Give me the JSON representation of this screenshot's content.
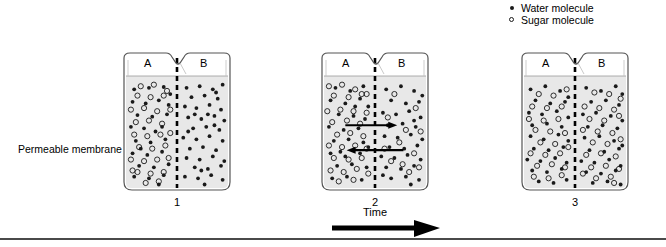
{
  "legend": {
    "items": [
      {
        "marker": "filled-dot",
        "label": "Water molecule"
      },
      {
        "marker": "open-circle",
        "label": "Sugar molecule"
      }
    ]
  },
  "annotations": {
    "membrane_label": "Permeable membrane",
    "time_label": "Time"
  },
  "beakers": [
    {
      "number": "1",
      "left_label": "A",
      "right_label": "B",
      "state": "initial",
      "x": 122,
      "sideA": {
        "water": [
          [
            10,
            12
          ],
          [
            28,
            10
          ],
          [
            46,
            9
          ],
          [
            8,
            28
          ],
          [
            24,
            30
          ],
          [
            40,
            26
          ],
          [
            52,
            32
          ],
          [
            14,
            45
          ],
          [
            32,
            47
          ],
          [
            50,
            44
          ],
          [
            6,
            60
          ],
          [
            22,
            62
          ],
          [
            44,
            60
          ],
          [
            12,
            78
          ],
          [
            30,
            80
          ],
          [
            48,
            76
          ],
          [
            8,
            94
          ],
          [
            26,
            96
          ],
          [
            44,
            92
          ],
          [
            16,
            110
          ],
          [
            34,
            112
          ],
          [
            52,
            108
          ],
          [
            10,
            124
          ],
          [
            28,
            126
          ],
          [
            46,
            122
          ],
          [
            20,
            136
          ],
          [
            40,
            134
          ],
          [
            54,
            18
          ],
          [
            36,
            66
          ],
          [
            18,
            88
          ]
        ],
        "sugar": [
          [
            18,
            8
          ],
          [
            34,
            6
          ],
          [
            50,
            14
          ],
          [
            14,
            20
          ],
          [
            30,
            22
          ],
          [
            46,
            20
          ],
          [
            6,
            38
          ],
          [
            22,
            36
          ],
          [
            38,
            40
          ],
          [
            54,
            38
          ],
          [
            12,
            54
          ],
          [
            28,
            52
          ],
          [
            44,
            56
          ],
          [
            10,
            70
          ],
          [
            26,
            72
          ],
          [
            42,
            70
          ],
          [
            54,
            68
          ],
          [
            16,
            86
          ],
          [
            32,
            88
          ],
          [
            48,
            84
          ],
          [
            6,
            102
          ],
          [
            22,
            104
          ],
          [
            38,
            102
          ],
          [
            52,
            100
          ],
          [
            14,
            118
          ],
          [
            30,
            120
          ],
          [
            46,
            118
          ],
          [
            24,
            132
          ],
          [
            40,
            130
          ],
          [
            8,
            116
          ]
        ]
      },
      "sideB": {
        "water": [
          [
            8,
            10
          ],
          [
            24,
            8
          ],
          [
            40,
            12
          ],
          [
            52,
            6
          ],
          [
            14,
            22
          ],
          [
            30,
            20
          ],
          [
            46,
            24
          ],
          [
            6,
            34
          ],
          [
            20,
            36
          ],
          [
            36,
            32
          ],
          [
            50,
            38
          ],
          [
            10,
            48
          ],
          [
            26,
            50
          ],
          [
            42,
            46
          ],
          [
            54,
            52
          ],
          [
            16,
            62
          ],
          [
            32,
            60
          ],
          [
            48,
            64
          ],
          [
            4,
            74
          ],
          [
            20,
            76
          ],
          [
            36,
            72
          ],
          [
            52,
            78
          ],
          [
            12,
            88
          ],
          [
            28,
            86
          ],
          [
            44,
            90
          ],
          [
            8,
            100
          ],
          [
            24,
            102
          ],
          [
            40,
            98
          ],
          [
            54,
            104
          ],
          [
            18,
            112
          ],
          [
            34,
            114
          ],
          [
            50,
            110
          ],
          [
            6,
            124
          ],
          [
            22,
            126
          ],
          [
            38,
            122
          ],
          [
            52,
            128
          ],
          [
            14,
            136
          ],
          [
            30,
            134
          ],
          [
            46,
            138
          ],
          [
            44,
            16
          ],
          [
            18,
            44
          ],
          [
            10,
            66
          ],
          [
            34,
            44
          ],
          [
            26,
            116
          ],
          [
            42,
            58
          ]
        ]
      }
    },
    {
      "number": "2",
      "left_label": "A",
      "right_label": "B",
      "state": "diffusing",
      "x": 320,
      "arrows": [
        {
          "direction": "right",
          "y": 58,
          "x_start": 26,
          "x_end": 76,
          "meaning": "sugar-moves-A-to-B"
        },
        {
          "direction": "left",
          "y": 90,
          "x_start": 30,
          "x_end": 86,
          "meaning": "water-moves-B-to-A"
        }
      ],
      "sideA": {
        "water": [
          [
            14,
            10
          ],
          [
            32,
            14
          ],
          [
            48,
            8
          ],
          [
            8,
            26
          ],
          [
            26,
            30
          ],
          [
            44,
            24
          ],
          [
            54,
            34
          ],
          [
            18,
            44
          ],
          [
            36,
            46
          ],
          [
            50,
            50
          ],
          [
            6,
            60
          ],
          [
            24,
            64
          ],
          [
            42,
            62
          ],
          [
            12,
            78
          ],
          [
            30,
            76
          ],
          [
            48,
            80
          ],
          [
            8,
            94
          ],
          [
            26,
            98
          ],
          [
            44,
            94
          ],
          [
            16,
            110
          ],
          [
            34,
            108
          ],
          [
            52,
            112
          ],
          [
            10,
            126
          ],
          [
            28,
            124
          ],
          [
            46,
            128
          ],
          [
            22,
            136
          ],
          [
            40,
            138
          ],
          [
            54,
            86
          ],
          [
            38,
            34
          ],
          [
            20,
            92
          ]
        ],
        "sugar": [
          [
            6,
            8
          ],
          [
            22,
            6
          ],
          [
            38,
            12
          ],
          [
            52,
            18
          ],
          [
            12,
            20
          ],
          [
            30,
            22
          ],
          [
            46,
            18
          ],
          [
            4,
            40
          ],
          [
            20,
            38
          ],
          [
            36,
            40
          ],
          [
            52,
            42
          ],
          [
            10,
            54
          ],
          [
            28,
            52
          ],
          [
            44,
            56
          ],
          [
            16,
            70
          ],
          [
            32,
            68
          ],
          [
            48,
            72
          ],
          [
            6,
            84
          ],
          [
            22,
            86
          ],
          [
            38,
            84
          ],
          [
            52,
            88
          ],
          [
            12,
            100
          ],
          [
            30,
            102
          ],
          [
            46,
            100
          ],
          [
            8,
            116
          ],
          [
            24,
            118
          ],
          [
            40,
            114
          ],
          [
            54,
            120
          ],
          [
            18,
            130
          ],
          [
            36,
            128
          ]
        ]
      },
      "sideB": {
        "water": [
          [
            10,
            12
          ],
          [
            28,
            8
          ],
          [
            44,
            14
          ],
          [
            54,
            20
          ],
          [
            16,
            26
          ],
          [
            34,
            30
          ],
          [
            50,
            28
          ],
          [
            6,
            42
          ],
          [
            22,
            44
          ],
          [
            38,
            40
          ],
          [
            52,
            48
          ],
          [
            12,
            58
          ],
          [
            30,
            56
          ],
          [
            46,
            60
          ],
          [
            8,
            72
          ],
          [
            24,
            74
          ],
          [
            40,
            70
          ],
          [
            54,
            76
          ],
          [
            14,
            86
          ],
          [
            32,
            88
          ],
          [
            48,
            84
          ],
          [
            4,
            98
          ],
          [
            20,
            100
          ],
          [
            36,
            96
          ],
          [
            52,
            102
          ],
          [
            10,
            112
          ],
          [
            28,
            114
          ],
          [
            44,
            110
          ],
          [
            16,
            126
          ],
          [
            34,
            124
          ],
          [
            50,
            128
          ],
          [
            22,
            136
          ],
          [
            40,
            134
          ],
          [
            6,
            122
          ],
          [
            44,
            52
          ]
        ],
        "sugar": [
          [
            20,
            18
          ],
          [
            46,
            36
          ],
          [
            12,
            48
          ],
          [
            34,
            64
          ],
          [
            52,
            66
          ],
          [
            26,
            80
          ],
          [
            44,
            94
          ],
          [
            16,
            104
          ],
          [
            38,
            118
          ],
          [
            8,
            88
          ],
          [
            30,
            108
          ],
          [
            50,
            112
          ]
        ]
      }
    },
    {
      "number": "3",
      "left_label": "A",
      "right_label": "B",
      "state": "equilibrium",
      "x": 520,
      "sideA": {
        "water": [
          [
            8,
            12
          ],
          [
            26,
            8
          ],
          [
            44,
            14
          ],
          [
            54,
            22
          ],
          [
            14,
            26
          ],
          [
            32,
            30
          ],
          [
            50,
            28
          ],
          [
            6,
            42
          ],
          [
            22,
            44
          ],
          [
            40,
            40
          ],
          [
            54,
            48
          ],
          [
            10,
            58
          ],
          [
            28,
            56
          ],
          [
            46,
            60
          ],
          [
            8,
            72
          ],
          [
            24,
            76
          ],
          [
            42,
            70
          ],
          [
            54,
            78
          ],
          [
            12,
            88
          ],
          [
            30,
            90
          ],
          [
            48,
            86
          ],
          [
            4,
            102
          ],
          [
            20,
            104
          ],
          [
            38,
            100
          ],
          [
            52,
            106
          ],
          [
            10,
            116
          ],
          [
            28,
            118
          ],
          [
            46,
            114
          ],
          [
            18,
            130
          ],
          [
            36,
            132
          ],
          [
            52,
            128
          ]
        ],
        "sugar": [
          [
            18,
            18
          ],
          [
            36,
            20
          ],
          [
            52,
            12
          ],
          [
            10,
            34
          ],
          [
            28,
            36
          ],
          [
            46,
            34
          ],
          [
            6,
            50
          ],
          [
            24,
            52
          ],
          [
            42,
            50
          ],
          [
            14,
            64
          ],
          [
            32,
            66
          ],
          [
            50,
            68
          ],
          [
            20,
            80
          ],
          [
            38,
            82
          ],
          [
            54,
            86
          ],
          [
            8,
            94
          ],
          [
            26,
            96
          ],
          [
            44,
            94
          ],
          [
            16,
            110
          ],
          [
            34,
            108
          ],
          [
            50,
            112
          ],
          [
            12,
            124
          ],
          [
            30,
            126
          ],
          [
            46,
            122
          ],
          [
            24,
            136
          ]
        ]
      },
      "sideB": {
        "water": [
          [
            10,
            10
          ],
          [
            28,
            14
          ],
          [
            46,
            8
          ],
          [
            54,
            18
          ],
          [
            16,
            28
          ],
          [
            34,
            26
          ],
          [
            50,
            32
          ],
          [
            6,
            44
          ],
          [
            22,
            42
          ],
          [
            40,
            46
          ],
          [
            54,
            52
          ],
          [
            12,
            60
          ],
          [
            30,
            58
          ],
          [
            48,
            62
          ],
          [
            8,
            74
          ],
          [
            26,
            72
          ],
          [
            44,
            78
          ],
          [
            54,
            84
          ],
          [
            14,
            90
          ],
          [
            32,
            92
          ],
          [
            50,
            88
          ],
          [
            4,
            104
          ],
          [
            20,
            106
          ],
          [
            38,
            102
          ],
          [
            52,
            110
          ],
          [
            10,
            118
          ],
          [
            28,
            120
          ],
          [
            46,
            116
          ],
          [
            18,
            132
          ],
          [
            36,
            130
          ],
          [
            52,
            134
          ]
        ],
        "sugar": [
          [
            20,
            16
          ],
          [
            38,
            18
          ],
          [
            52,
            24
          ],
          [
            8,
            34
          ],
          [
            26,
            36
          ],
          [
            44,
            38
          ],
          [
            14,
            50
          ],
          [
            32,
            52
          ],
          [
            50,
            46
          ],
          [
            6,
            64
          ],
          [
            24,
            66
          ],
          [
            42,
            68
          ],
          [
            18,
            80
          ],
          [
            36,
            82
          ],
          [
            52,
            76
          ],
          [
            10,
            96
          ],
          [
            28,
            94
          ],
          [
            46,
            98
          ],
          [
            16,
            112
          ],
          [
            34,
            110
          ],
          [
            50,
            114
          ],
          [
            22,
            126
          ],
          [
            40,
            124
          ],
          [
            6,
            120
          ],
          [
            44,
            132
          ]
        ]
      }
    }
  ]
}
